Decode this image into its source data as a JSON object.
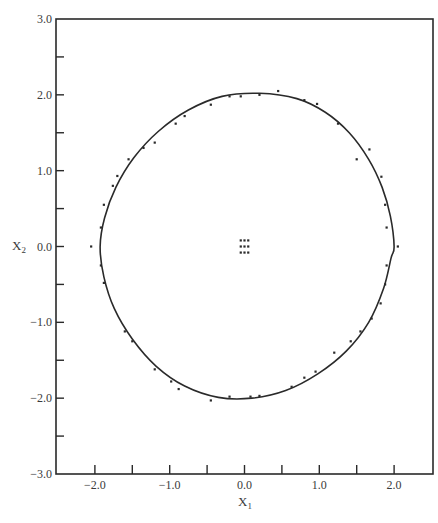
{
  "chart_data": {
    "type": "scatter",
    "title": "",
    "xlabel": "X1",
    "ylabel": "X2",
    "xlim": [
      -2.52,
      2.52
    ],
    "ylim": [
      -3.0,
      3.0
    ],
    "grid": false,
    "legend": null,
    "x_ticks": [
      {
        "value": -2.0,
        "label": "−2.0"
      },
      {
        "value": -1.5,
        "label": ""
      },
      {
        "value": -1.0,
        "label": "−1.0"
      },
      {
        "value": -0.5,
        "label": ""
      },
      {
        "value": 0.0,
        "label": "0.0"
      },
      {
        "value": 0.5,
        "label": ""
      },
      {
        "value": 1.0,
        "label": "1.0"
      },
      {
        "value": 1.5,
        "label": ""
      },
      {
        "value": 2.0,
        "label": "2.0"
      }
    ],
    "y_ticks": [
      {
        "value": 3.0,
        "label": "3.0"
      },
      {
        "value": 2.5,
        "label": ""
      },
      {
        "value": 2.0,
        "label": "2.0"
      },
      {
        "value": 1.5,
        "label": ""
      },
      {
        "value": 1.0,
        "label": "1.0"
      },
      {
        "value": 0.5,
        "label": ""
      },
      {
        "value": 0.0,
        "label": "0.0"
      },
      {
        "value": -0.5,
        "label": ""
      },
      {
        "value": -1.0,
        "label": "−1.0"
      },
      {
        "value": -1.5,
        "label": ""
      },
      {
        "value": -2.0,
        "label": "−2.0"
      },
      {
        "value": -2.5,
        "label": ""
      },
      {
        "value": -3.0,
        "label": "−3.0"
      }
    ],
    "series": [
      {
        "name": "limit cycle (fitted curve)",
        "type": "line",
        "points": [
          [
            2.0,
            0.0
          ],
          [
            1.95,
            0.4
          ],
          [
            1.84,
            0.78
          ],
          [
            1.66,
            1.15
          ],
          [
            1.4,
            1.5
          ],
          [
            1.08,
            1.77
          ],
          [
            0.7,
            1.95
          ],
          [
            0.2,
            2.02
          ],
          [
            -0.3,
            1.98
          ],
          [
            -0.75,
            1.8
          ],
          [
            -1.15,
            1.52
          ],
          [
            -1.48,
            1.17
          ],
          [
            -1.72,
            0.78
          ],
          [
            -1.87,
            0.38
          ],
          [
            -1.93,
            0.0
          ],
          [
            -1.88,
            -0.4
          ],
          [
            -1.74,
            -0.82
          ],
          [
            -1.5,
            -1.22
          ],
          [
            -1.18,
            -1.58
          ],
          [
            -0.8,
            -1.84
          ],
          [
            -0.35,
            -1.99
          ],
          [
            0.1,
            -2.0
          ],
          [
            0.55,
            -1.9
          ],
          [
            0.98,
            -1.68
          ],
          [
            1.36,
            -1.38
          ],
          [
            1.66,
            -1.0
          ],
          [
            1.86,
            -0.55
          ],
          [
            1.96,
            -0.15
          ]
        ]
      },
      {
        "name": "trajectory points",
        "type": "scatter",
        "points": [
          [
            2.05,
            0.0
          ],
          [
            1.9,
            0.25
          ],
          [
            1.88,
            0.55
          ],
          [
            1.83,
            0.92
          ],
          [
            1.67,
            1.28
          ],
          [
            1.5,
            1.15
          ],
          [
            1.25,
            1.62
          ],
          [
            0.97,
            1.88
          ],
          [
            0.8,
            1.93
          ],
          [
            0.45,
            2.05
          ],
          [
            0.2,
            2.0
          ],
          [
            -0.05,
            1.98
          ],
          [
            -0.2,
            1.98
          ],
          [
            -0.45,
            1.87
          ],
          [
            -0.8,
            1.72
          ],
          [
            -0.92,
            1.62
          ],
          [
            -1.2,
            1.37
          ],
          [
            -1.35,
            1.3
          ],
          [
            -1.55,
            1.15
          ],
          [
            -1.7,
            0.93
          ],
          [
            -1.76,
            0.8
          ],
          [
            -1.88,
            0.55
          ],
          [
            -1.92,
            0.25
          ],
          [
            -2.05,
            0.0
          ],
          [
            -1.92,
            -0.25
          ],
          [
            -1.88,
            -0.48
          ],
          [
            -1.6,
            -1.12
          ],
          [
            -1.5,
            -1.25
          ],
          [
            -1.2,
            -1.62
          ],
          [
            -0.98,
            -1.78
          ],
          [
            -0.88,
            -1.88
          ],
          [
            -0.45,
            -2.03
          ],
          [
            -0.2,
            -1.98
          ],
          [
            0.08,
            -1.98
          ],
          [
            0.2,
            -1.97
          ],
          [
            0.63,
            -1.85
          ],
          [
            0.8,
            -1.73
          ],
          [
            0.95,
            -1.65
          ],
          [
            1.2,
            -1.4
          ],
          [
            1.42,
            -1.25
          ],
          [
            1.55,
            -1.12
          ],
          [
            1.7,
            -0.95
          ],
          [
            1.82,
            -0.75
          ],
          [
            1.88,
            -0.5
          ],
          [
            1.9,
            -0.25
          ]
        ]
      },
      {
        "name": "initial grid points",
        "type": "scatter",
        "points": [
          [
            -0.05,
            0.08
          ],
          [
            0.0,
            0.08
          ],
          [
            0.05,
            0.08
          ],
          [
            -0.05,
            0.0
          ],
          [
            0.0,
            0.0
          ],
          [
            0.05,
            0.0
          ],
          [
            -0.05,
            -0.08
          ],
          [
            0.0,
            -0.08
          ],
          [
            0.05,
            -0.08
          ]
        ]
      }
    ]
  },
  "axes": {
    "x_label_main": "X",
    "x_label_sub": "1",
    "y_label_main": "X",
    "y_label_sub": "2"
  },
  "colors": {
    "ink": "#2a2a2a",
    "background": "#ffffff"
  }
}
